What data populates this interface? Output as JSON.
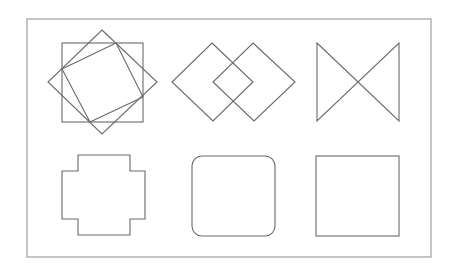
{
  "diagram": {
    "frame": {
      "stroke": "#a8a8a8"
    },
    "line_color": "#6a6a6a",
    "figures": [
      {
        "name": "overlapping rotated squares",
        "row": 1,
        "col": 1
      },
      {
        "name": "two overlapping diamonds",
        "row": 1,
        "col": 2
      },
      {
        "name": "bowtie",
        "row": 1,
        "col": 3
      },
      {
        "name": "cross / stepped octagon",
        "row": 2,
        "col": 1
      },
      {
        "name": "rounded square",
        "row": 2,
        "col": 2
      },
      {
        "name": "square",
        "row": 2,
        "col": 3
      }
    ]
  }
}
